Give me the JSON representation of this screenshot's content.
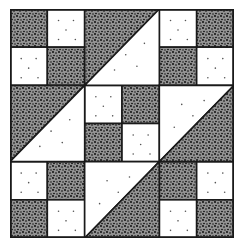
{
  "colors": {
    "dark": "#2b2b2b",
    "light": "#ffffff",
    "line": "#1a1a1a",
    "dot": "#555555"
  },
  "grid": {
    "units": 6,
    "width": 224,
    "height": 229
  },
  "squares": [
    {
      "r": 0,
      "c": 0,
      "fill": "dark"
    },
    {
      "r": 0,
      "c": 1,
      "fill": "light"
    },
    {
      "r": 1,
      "c": 0,
      "fill": "light"
    },
    {
      "r": 1,
      "c": 1,
      "fill": "dark"
    },
    {
      "r": 0,
      "c": 4,
      "fill": "light"
    },
    {
      "r": 0,
      "c": 5,
      "fill": "dark"
    },
    {
      "r": 1,
      "c": 4,
      "fill": "dark"
    },
    {
      "r": 1,
      "c": 5,
      "fill": "light"
    },
    {
      "r": 4,
      "c": 0,
      "fill": "light"
    },
    {
      "r": 4,
      "c": 1,
      "fill": "dark"
    },
    {
      "r": 5,
      "c": 0,
      "fill": "dark"
    },
    {
      "r": 5,
      "c": 1,
      "fill": "light"
    },
    {
      "r": 4,
      "c": 4,
      "fill": "dark"
    },
    {
      "r": 4,
      "c": 5,
      "fill": "light"
    },
    {
      "r": 5,
      "c": 4,
      "fill": "light"
    },
    {
      "r": 5,
      "c": 5,
      "fill": "dark"
    },
    {
      "r": 2,
      "c": 2,
      "fill": "light"
    },
    {
      "r": 2,
      "c": 3,
      "fill": "dark"
    },
    {
      "r": 3,
      "c": 2,
      "fill": "dark"
    },
    {
      "r": 3,
      "c": 3,
      "fill": "light"
    }
  ],
  "triangles": [
    {
      "r": 0,
      "c": 2,
      "upper": "dark",
      "lower": "light"
    },
    {
      "r": 2,
      "c": 0,
      "upper": "dark",
      "lower": "light"
    },
    {
      "r": 2,
      "c": 4,
      "upper": "light",
      "lower": "dark"
    },
    {
      "r": 4,
      "c": 2,
      "upper": "light",
      "lower": "dark"
    }
  ]
}
